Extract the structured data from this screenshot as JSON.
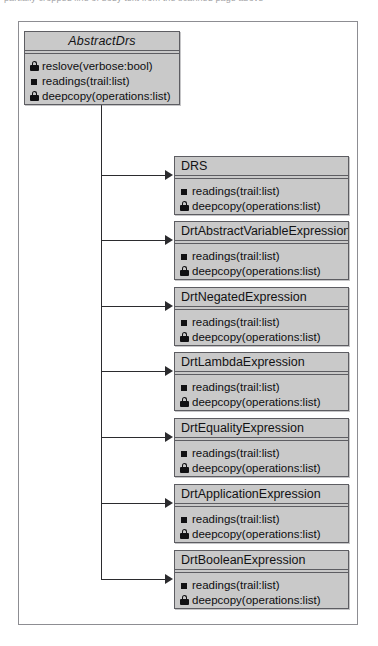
{
  "page": {
    "top_fragment_text": "partially cropped line of body text from the scanned page above"
  },
  "diagram": {
    "type": "uml-class-diagram",
    "base_class": {
      "name": "AbstractDrs",
      "is_abstract": true,
      "x": 23,
      "y": 30,
      "width": 156,
      "height": 74,
      "members": [
        {
          "visibility": "protected",
          "icon": "padlock-icon",
          "label": "reslove(verbose:bool)"
        },
        {
          "visibility": "public",
          "icon": "filled-square-icon",
          "label": "readings(trail:list)"
        },
        {
          "visibility": "protected",
          "icon": "padlock-icon",
          "label": "deepcopy(operations:list)"
        }
      ]
    },
    "subclasses": [
      {
        "name": "DRS",
        "x": 173,
        "y": 155,
        "width": 175,
        "height": 59,
        "members": [
          {
            "visibility": "public",
            "icon": "filled-square-icon",
            "label": "readings(trail:list)"
          },
          {
            "visibility": "protected",
            "icon": "padlock-icon",
            "label": "deepcopy(operations:list)"
          }
        ]
      },
      {
        "name": "DrtAbstractVariableExpression",
        "x": 173,
        "y": 220,
        "width": 175,
        "height": 59,
        "members": [
          {
            "visibility": "public",
            "icon": "filled-square-icon",
            "label": "readings(trail:list)"
          },
          {
            "visibility": "protected",
            "icon": "padlock-icon",
            "label": "deepcopy(operations:list)"
          }
        ]
      },
      {
        "name": "DrtNegatedExpression",
        "x": 173,
        "y": 286,
        "width": 175,
        "height": 59,
        "members": [
          {
            "visibility": "public",
            "icon": "filled-square-icon",
            "label": "readings(trail:list)"
          },
          {
            "visibility": "protected",
            "icon": "padlock-icon",
            "label": "deepcopy(operations:list)"
          }
        ]
      },
      {
        "name": "DrtLambdaExpression",
        "x": 173,
        "y": 351,
        "width": 175,
        "height": 59,
        "members": [
          {
            "visibility": "public",
            "icon": "filled-square-icon",
            "label": "readings(trail:list)"
          },
          {
            "visibility": "protected",
            "icon": "padlock-icon",
            "label": "deepcopy(operations:list)"
          }
        ]
      },
      {
        "name": "DrtEqualityExpression",
        "x": 173,
        "y": 417,
        "width": 175,
        "height": 59,
        "members": [
          {
            "visibility": "public",
            "icon": "filled-square-icon",
            "label": "readings(trail:list)"
          },
          {
            "visibility": "protected",
            "icon": "padlock-icon",
            "label": "deepcopy(operations:list)"
          }
        ]
      },
      {
        "name": "DrtApplicationExpression",
        "x": 173,
        "y": 483,
        "width": 175,
        "height": 59,
        "members": [
          {
            "visibility": "public",
            "icon": "filled-square-icon",
            "label": "readings(trail:list)"
          },
          {
            "visibility": "protected",
            "icon": "padlock-icon",
            "label": "deepcopy(operations:list)"
          }
        ]
      },
      {
        "name": "DrtBooleanExpression",
        "x": 173,
        "y": 549,
        "width": 175,
        "height": 59,
        "members": [
          {
            "visibility": "public",
            "icon": "filled-square-icon",
            "label": "readings(trail:list)"
          },
          {
            "visibility": "protected",
            "icon": "padlock-icon",
            "label": "deepcopy(operations:list)"
          }
        ]
      }
    ],
    "connector": {
      "style": "orthogonal-tree",
      "trunk_x": 100,
      "trunk_top": 104,
      "trunk_bottom": 578,
      "arrow_x": 164,
      "branch_ys": [
        174,
        239,
        305,
        370,
        436,
        502,
        578
      ]
    },
    "colors": {
      "box_fill": "#c9c9c9",
      "box_border": "#5d5d62",
      "frame_border": "#8d8d92",
      "line": "#2b2b2e",
      "text": "#121214",
      "page_background": "#ffffff"
    }
  }
}
